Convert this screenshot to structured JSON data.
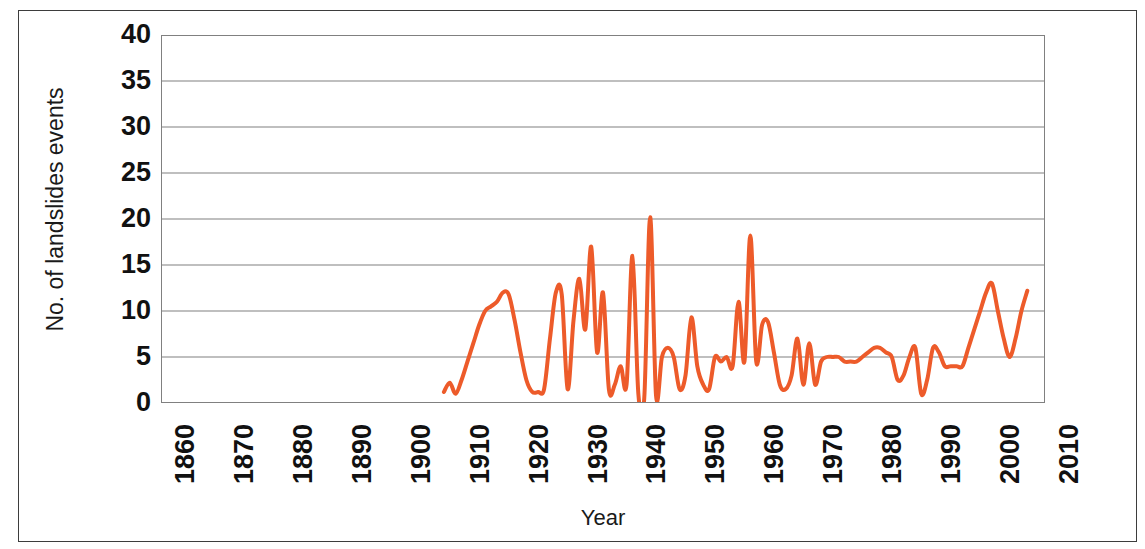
{
  "chart_data": {
    "type": "line",
    "title": "",
    "xlabel": "Year",
    "ylabel": "No. of landslides events",
    "xlim": [
      1860,
      2010
    ],
    "ylim": [
      0,
      40
    ],
    "xticks": [
      1860,
      1870,
      1880,
      1890,
      1900,
      1910,
      1920,
      1930,
      1940,
      1950,
      1960,
      1970,
      1980,
      1990,
      2000,
      2010
    ],
    "yticks": [
      0,
      5,
      10,
      15,
      20,
      25,
      30,
      35,
      40
    ],
    "grid": "horizontal",
    "legend": "none",
    "line_color": "#ED5B2A",
    "line_width": 4,
    "series": [
      {
        "name": "No. of landslides events",
        "x": [
          1908,
          1909,
          1910,
          1911,
          1912,
          1913,
          1914,
          1915,
          1916,
          1917,
          1918,
          1919,
          1920,
          1921,
          1922,
          1923,
          1924,
          1925,
          1926,
          1927,
          1928,
          1929,
          1930,
          1931,
          1932,
          1933,
          1934,
          1935,
          1936,
          1937,
          1938,
          1939,
          1940,
          1941,
          1942,
          1943,
          1944,
          1945,
          1946,
          1947,
          1948,
          1949,
          1950,
          1951,
          1952,
          1953,
          1954,
          1955,
          1956,
          1957,
          1958,
          1959,
          1960,
          1961,
          1962,
          1963,
          1964,
          1965,
          1966,
          1967,
          1968,
          1969,
          1970,
          1971,
          1972,
          1973,
          1974,
          1975,
          1976,
          1977,
          1978,
          1979,
          1980,
          1981,
          1982,
          1983,
          1984,
          1985,
          1986,
          1987,
          1988,
          1989,
          1990,
          1991,
          1992,
          1993,
          1994,
          1995,
          1996,
          1997,
          1998,
          1999,
          2000,
          2001,
          2002,
          2003,
          2004,
          2005,
          2006,
          2007
        ],
        "values": [
          1.2,
          2.2,
          1.0,
          2.5,
          4.5,
          6.5,
          8.5,
          10.0,
          10.5,
          11.0,
          12.0,
          11.8,
          9.0,
          5.5,
          2.5,
          1.2,
          1.2,
          1.5,
          7.0,
          12.0,
          11.8,
          1.5,
          9.0,
          13.5,
          8.0,
          17.0,
          5.5,
          12.0,
          1.5,
          2.0,
          4.0,
          2.0,
          16.0,
          1.0,
          0.5,
          20.2,
          0.8,
          5.0,
          6.0,
          5.0,
          1.5,
          3.0,
          9.3,
          4.0,
          2.0,
          1.5,
          5.0,
          4.5,
          5.0,
          4.0,
          11.0,
          4.5,
          18.2,
          4.5,
          8.5,
          8.8,
          5.5,
          2.0,
          1.5,
          3.0,
          7.0,
          2.0,
          6.5,
          2.0,
          4.5,
          5.0,
          5.0,
          5.0,
          4.5,
          4.5,
          4.5,
          5.0,
          5.5,
          6.0,
          6.0,
          5.5,
          5.0,
          2.5,
          3.0,
          5.0,
          6.0,
          1.0,
          2.5,
          6.0,
          5.5,
          4.0,
          4.0,
          4.0,
          4.0,
          6.0,
          8.0,
          10.0,
          12.0,
          13.0,
          10.0,
          7.0,
          5.0,
          7.0,
          10.0,
          12.2
        ]
      }
    ]
  },
  "axes": {
    "ylabel": "No. of landslides events",
    "xlabel": "Year",
    "ytick_labels": [
      "40",
      "35",
      "30",
      "25",
      "20",
      "15",
      "10",
      "5",
      "0"
    ],
    "xtick_labels": [
      "1860",
      "1870",
      "1880",
      "1890",
      "1900",
      "1910",
      "1920",
      "1930",
      "1940",
      "1950",
      "1960",
      "1970",
      "1980",
      "1990",
      "2000",
      "2010"
    ]
  }
}
